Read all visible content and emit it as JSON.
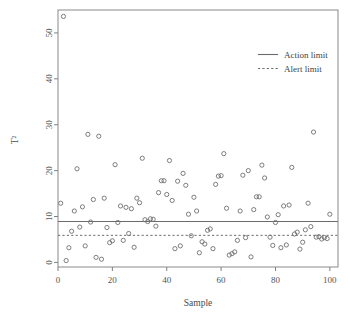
{
  "chart_data": {
    "type": "scatter",
    "title": "",
    "xlabel": "Sample",
    "ylabel": "T²",
    "xlim": [
      0,
      103
    ],
    "ylim": [
      -1,
      55
    ],
    "xticks": [
      0,
      20,
      40,
      60,
      80,
      100
    ],
    "xtick_labels": [
      "0",
      "20",
      "40",
      "60",
      "80",
      "100"
    ],
    "yticks": [
      0,
      10,
      20,
      30,
      40,
      50
    ],
    "ytick_labels": [
      "0",
      "10",
      "20",
      "30",
      "40",
      "50"
    ],
    "grid": false,
    "legend_position": "top-right",
    "legend": [
      {
        "label": "Action limit",
        "style": "solid"
      },
      {
        "label": "Alert limit",
        "style": "dashed"
      }
    ],
    "reference_lines": [
      {
        "name": "Action limit",
        "value": 8.9,
        "style": "solid"
      },
      {
        "name": "Alert limit",
        "value": 5.9,
        "style": "dashed"
      }
    ],
    "series": [
      {
        "name": "T2 statistic",
        "marker": "open-circle",
        "x": [
          1,
          2,
          3,
          4,
          5,
          6,
          7,
          8,
          9,
          10,
          11,
          12,
          13,
          14,
          15,
          16,
          17,
          18,
          19,
          20,
          21,
          22,
          23,
          24,
          25,
          26,
          27,
          28,
          29,
          30,
          31,
          32,
          33,
          34,
          35,
          36,
          37,
          38,
          39,
          40,
          41,
          42,
          43,
          44,
          45,
          46,
          47,
          48,
          49,
          50,
          51,
          52,
          53,
          54,
          55,
          56,
          57,
          58,
          59,
          60,
          61,
          62,
          63,
          64,
          65,
          66,
          67,
          68,
          69,
          70,
          71,
          72,
          73,
          74,
          75,
          76,
          77,
          78,
          79,
          80,
          81,
          82,
          83,
          84,
          85,
          86,
          87,
          88,
          89,
          90,
          91,
          92,
          93,
          94,
          95,
          96,
          97,
          98,
          99,
          100
        ],
        "y": [
          12.9,
          53.6,
          0.4,
          3.2,
          6.8,
          11.2,
          20.4,
          7.7,
          12.1,
          3.6,
          27.9,
          8.8,
          13.7,
          1.1,
          27.5,
          0.7,
          14.0,
          7.6,
          4.3,
          4.7,
          21.3,
          8.7,
          12.3,
          4.8,
          12.0,
          6.3,
          11.7,
          3.3,
          14.0,
          13.0,
          22.7,
          9.3,
          8.9,
          9.5,
          9.4,
          7.9,
          15.2,
          17.8,
          17.8,
          14.8,
          22.2,
          13.5,
          3.0,
          17.7,
          3.6,
          19.4,
          16.8,
          10.5,
          5.8,
          14.2,
          11.2,
          2.1,
          4.5,
          4.0,
          7.0,
          7.3,
          3.0,
          17.0,
          18.8,
          18.9,
          23.7,
          11.8,
          1.6,
          1.9,
          2.3,
          4.8,
          11.2,
          19.0,
          5.4,
          20.0,
          1.2,
          11.5,
          14.3,
          14.3,
          21.2,
          18.4,
          9.9,
          5.5,
          3.7,
          8.7,
          10.4,
          3.2,
          12.3,
          3.8,
          12.5,
          20.7,
          6.2,
          6.6,
          2.9,
          4.4,
          7.1,
          12.9,
          7.8,
          28.4,
          5.5,
          5.6,
          5.1,
          5.4,
          5.2,
          10.5
        ]
      }
    ]
  },
  "legend": {
    "action_limit_label": "Action limit",
    "alert_limit_label": "Alert limit"
  },
  "axes": {
    "x_title": "Sample",
    "y_title": "T²"
  },
  "colors": {
    "marker_stroke": "#6f6f6f",
    "limit_line": "#6b6b6b",
    "frame": "#8a8a8a",
    "text": "#4a4a4a",
    "background": "#ffffff"
  }
}
